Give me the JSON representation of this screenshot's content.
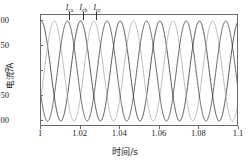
{
  "axes": {
    "ylabel": "电流/A",
    "xlabel": "时间/s",
    "yticks": [
      "100",
      "50",
      "0",
      "-50",
      "-100"
    ],
    "xticks": [
      "1",
      "1.02",
      "1.04",
      "1.06",
      "1.08",
      "1.1"
    ]
  },
  "annotations": [
    {
      "label": "I",
      "sub": "ca"
    },
    {
      "label": "I",
      "sub": "cb"
    },
    {
      "label": "I",
      "sub": "cc"
    }
  ],
  "chart_data": {
    "type": "line",
    "title": "",
    "xlabel": "时间/s",
    "ylabel": "电流/A",
    "xlim": [
      1.0,
      1.1
    ],
    "ylim": [
      -112,
      112
    ],
    "xticks": [
      1.0,
      1.02,
      1.04,
      1.06,
      1.08,
      1.1
    ],
    "yticks": [
      100,
      50,
      0,
      -50,
      -100
    ],
    "grid": false,
    "legend": "inline-annotations",
    "frequency_hz": 50,
    "amplitude_a": 100,
    "series": [
      {
        "name": "I_ca",
        "color": "#262626",
        "phase_deg": 90,
        "annotation_x": 1.0145,
        "values_note": "i = 100*sin(2*pi*50*t + 90deg)"
      },
      {
        "name": "I_cb",
        "color": "#a8a8a8",
        "phase_deg": -30,
        "annotation_x": 1.0215,
        "values_note": "i = 100*sin(2*pi*50*t - 30deg)"
      },
      {
        "name": "I_cc",
        "color": "#3c3c3c",
        "phase_deg": 210,
        "annotation_x": 1.0285,
        "values_note": "i = 100*sin(2*pi*50*t + 210deg)"
      }
    ]
  }
}
